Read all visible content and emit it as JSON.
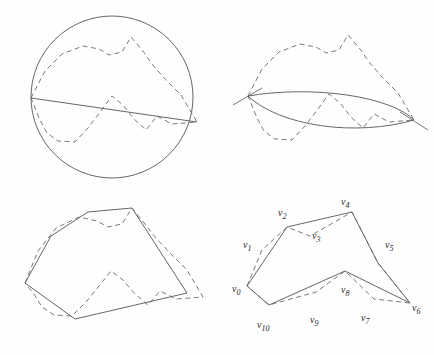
{
  "figure": {
    "background_color": "#fefefe",
    "stroke_color": "#555555",
    "dash_color": "#6a6a6a",
    "label_color": "#2b2b2b"
  },
  "panels": [
    {
      "id": "panel-top-left",
      "name": "circle-with-chord",
      "shapes": {
        "circle": {
          "cx": 112,
          "cy": 97,
          "r": 81
        },
        "chord": [
          [
            31,
            98
          ],
          [
            197,
            122
          ]
        ],
        "dashed_polyline": [
          [
            31,
            98
          ],
          [
            45,
            71
          ],
          [
            62,
            54
          ],
          [
            83,
            46
          ],
          [
            99,
            49
          ],
          [
            109,
            55
          ],
          [
            122,
            52
          ],
          [
            131,
            37
          ],
          [
            143,
            51
          ],
          [
            152,
            64
          ],
          [
            165,
            79
          ],
          [
            181,
            95
          ],
          [
            197,
            122
          ],
          [
            172,
            124
          ],
          [
            157,
            116
          ],
          [
            146,
            130
          ],
          [
            134,
            119
          ],
          [
            123,
            105
          ],
          [
            112,
            96
          ],
          [
            101,
            111
          ],
          [
            88,
            128
          ],
          [
            75,
            142
          ],
          [
            58,
            141
          ],
          [
            47,
            133
          ],
          [
            40,
            120
          ],
          [
            31,
            98
          ]
        ]
      }
    },
    {
      "id": "panel-top-right",
      "name": "lens-two-arcs",
      "shapes": {
        "arc_upper": {
          "from": [
            248,
            96
          ],
          "to": [
            414,
            120
          ],
          "sweep_ry": 42,
          "bulge": "up"
        },
        "arc_lower": {
          "from": [
            248,
            96
          ],
          "to": [
            414,
            120
          ],
          "sweep_ry": 60,
          "bulge": "down"
        },
        "tick_left": [
          [
            233,
            105
          ],
          [
            262,
            88
          ]
        ],
        "tick_right": [
          [
            400,
            112
          ],
          [
            428,
            130
          ]
        ],
        "dashed_polyline": [
          [
            248,
            96
          ],
          [
            262,
            69
          ],
          [
            279,
            52
          ],
          [
            300,
            44
          ],
          [
            316,
            47
          ],
          [
            326,
            53
          ],
          [
            339,
            50
          ],
          [
            348,
            35
          ],
          [
            360,
            49
          ],
          [
            369,
            62
          ],
          [
            382,
            77
          ],
          [
            398,
            93
          ],
          [
            414,
            120
          ],
          [
            389,
            122
          ],
          [
            374,
            114
          ],
          [
            363,
            128
          ],
          [
            351,
            117
          ],
          [
            340,
            103
          ],
          [
            329,
            94
          ],
          [
            318,
            109
          ],
          [
            305,
            126
          ],
          [
            292,
            140
          ],
          [
            275,
            139
          ],
          [
            264,
            131
          ],
          [
            257,
            118
          ],
          [
            248,
            96
          ]
        ]
      }
    },
    {
      "id": "panel-bottom-left",
      "name": "convex-hull-polygon",
      "shapes": {
        "solid_polygon": [
          [
            25,
            283
          ],
          [
            51,
            236
          ],
          [
            88,
            212
          ],
          [
            132,
            208
          ],
          [
            187,
            293
          ],
          [
            75,
            319
          ],
          [
            25,
            283
          ]
        ],
        "dashed_polyline": [
          [
            25,
            283
          ],
          [
            38,
            251
          ],
          [
            56,
            228
          ],
          [
            79,
            217
          ],
          [
            97,
            221
          ],
          [
            108,
            227
          ],
          [
            122,
            224
          ],
          [
            132,
            208
          ],
          [
            145,
            224
          ],
          [
            155,
            237
          ],
          [
            170,
            253
          ],
          [
            187,
            270
          ],
          [
            203,
            297
          ],
          [
            176,
            299
          ],
          [
            160,
            291
          ],
          [
            148,
            305
          ],
          [
            135,
            294
          ],
          [
            123,
            280
          ],
          [
            111,
            271
          ],
          [
            99,
            286
          ],
          [
            86,
            302
          ],
          [
            72,
            316
          ],
          [
            54,
            315
          ],
          [
            42,
            307
          ],
          [
            34,
            294
          ],
          [
            25,
            283
          ]
        ]
      }
    },
    {
      "id": "panel-bottom-right",
      "name": "labeled-polygon",
      "shapes": {
        "solid_polygon": [
          [
            247,
            286
          ],
          [
            287,
            227
          ],
          [
            352,
            212
          ],
          [
            378,
            263
          ],
          [
            410,
            303
          ],
          [
            345,
            271
          ],
          [
            269,
            305
          ],
          [
            247,
            286
          ]
        ],
        "dashed_polyline": [
          [
            247,
            286
          ],
          [
            262,
            250
          ],
          [
            287,
            227
          ],
          [
            310,
            236
          ],
          [
            352,
            212
          ],
          [
            378,
            263
          ],
          [
            410,
            303
          ],
          [
            374,
            299
          ],
          [
            345,
            271
          ],
          [
            316,
            292
          ],
          [
            269,
            305
          ],
          [
            247,
            286
          ]
        ],
        "vertices": [
          {
            "id": "v0",
            "x": 247,
            "y": 286,
            "label_x": 232,
            "label_y": 284
          },
          {
            "id": "v1",
            "x": 262,
            "y": 250,
            "label_x": 243,
            "label_y": 240
          },
          {
            "id": "v2",
            "x": 287,
            "y": 227,
            "label_x": 278,
            "label_y": 208
          },
          {
            "id": "v3",
            "x": 313,
            "y": 238,
            "label_x": 312,
            "label_y": 231
          },
          {
            "id": "v4",
            "x": 352,
            "y": 212,
            "label_x": 341,
            "label_y": 197
          },
          {
            "id": "v5",
            "x": 378,
            "y": 263,
            "label_x": 385,
            "label_y": 240
          },
          {
            "id": "v6",
            "x": 410,
            "y": 303,
            "label_x": 412,
            "label_y": 303
          },
          {
            "id": "v7",
            "x": 374,
            "y": 299,
            "label_x": 361,
            "label_y": 313
          },
          {
            "id": "v8",
            "x": 345,
            "y": 271,
            "label_x": 341,
            "label_y": 285
          },
          {
            "id": "v9",
            "x": 316,
            "y": 292,
            "label_x": 310,
            "label_y": 315
          },
          {
            "id": "v10",
            "x": 269,
            "y": 305,
            "label_x": 257,
            "label_y": 320
          }
        ]
      }
    }
  ],
  "vertex_labels": [
    {
      "base": "v",
      "sub": "0"
    },
    {
      "base": "v",
      "sub": "1"
    },
    {
      "base": "v",
      "sub": "2"
    },
    {
      "base": "v",
      "sub": "3"
    },
    {
      "base": "v",
      "sub": "4"
    },
    {
      "base": "v",
      "sub": "5"
    },
    {
      "base": "v",
      "sub": "6"
    },
    {
      "base": "v",
      "sub": "7"
    },
    {
      "base": "v",
      "sub": "8"
    },
    {
      "base": "v",
      "sub": "9"
    },
    {
      "base": "v",
      "sub": "10"
    }
  ]
}
